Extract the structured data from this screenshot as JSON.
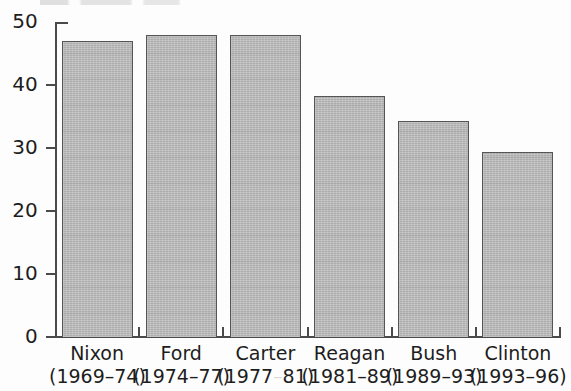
{
  "chart_data": {
    "type": "bar",
    "title": "",
    "subtitle": "",
    "xlabel": "",
    "ylabel": "",
    "categories": [
      "Nixon",
      "Ford",
      "Carter",
      "Reagan",
      "Bush",
      "Clinton"
    ],
    "category_sublabels": [
      "(1969–74)",
      "(1974–77)",
      "(1977–81)",
      "(1981–89)",
      "(1989–93)",
      "(1993–96)"
    ],
    "values": [
      47,
      48,
      48,
      38.3,
      34.3,
      29.4
    ],
    "ylim": [
      0,
      50
    ],
    "yticks": [
      0,
      10,
      20,
      30,
      40,
      50
    ],
    "ytick_labels": [
      "0",
      "10",
      "20",
      "30",
      "40",
      "50"
    ],
    "grid": false,
    "legend": null,
    "bar_color": "#b9b9b9",
    "bar_edge_color": "#555555",
    "axis_color": "#4a4a4a",
    "annotations": []
  },
  "axis": {
    "tick_0": "0",
    "tick_10": "10",
    "tick_20": "20",
    "tick_30": "30",
    "tick_40": "40",
    "tick_50": "50"
  },
  "bars": [
    {
      "name": "Nixon",
      "term": "(1969–74)",
      "value": 47
    },
    {
      "name": "Ford",
      "term": "(1974–77)",
      "value": 48
    },
    {
      "name": "Carter",
      "term": "(1977–81)",
      "value": 48
    },
    {
      "name": "Reagan",
      "term": "(1981–89)",
      "value": 38.3
    },
    {
      "name": "Bush",
      "term": "(1989–93)",
      "value": 34.3
    },
    {
      "name": "Clinton",
      "term": "(1993–96)",
      "value": 29.4
    }
  ]
}
